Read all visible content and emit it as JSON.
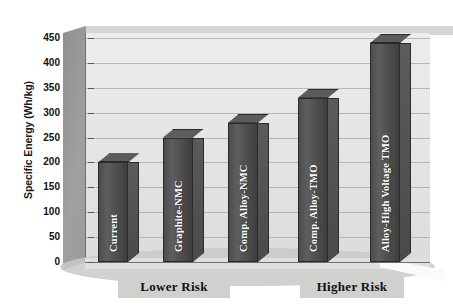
{
  "chart_data": {
    "type": "bar",
    "title": "",
    "subtitle": "",
    "xlabel": "",
    "ylabel": "Specific Energy (Wh/kg)",
    "ylim": [
      0,
      450
    ],
    "grid": true,
    "legend": "none",
    "style": "3d-bar",
    "categories": [
      "Current",
      "Graphite-NMC",
      "Comp. Alloy-NMC",
      "Comp. Alloy-TMO",
      "Alloy-High Voltage TMO"
    ],
    "values": [
      200,
      250,
      280,
      330,
      440
    ],
    "y_ticks": [
      0,
      50,
      100,
      150,
      200,
      250,
      300,
      350,
      400,
      450
    ],
    "groups": [
      {
        "label": "Lower Risk",
        "members": [
          "Current",
          "Graphite-NMC",
          "Comp. Alloy-NMC"
        ]
      },
      {
        "label": "Higher Risk",
        "members": [
          "Comp. Alloy-TMO",
          "Alloy-High Voltage TMO"
        ]
      }
    ],
    "colors": {
      "bar_face": "#4c4c4c",
      "bar_top": "#5c5c5c",
      "bar_side": "#4a4a4a",
      "bar_outline": "#2b2b2b",
      "plot_back_wall": "#e8e8e6",
      "plot_left_wall": "#989896",
      "gridline": "#b6b6b4",
      "floor": "#c9c9c7",
      "group_label_bg": "#d0d0ce",
      "text": "#111111",
      "bar_label_text": "#ffffff",
      "page_background": "#ffffff"
    }
  },
  "axis": {
    "y_title": "Specific Energy (Wh/kg)",
    "ticks": [
      {
        "value": "450"
      },
      {
        "value": "400"
      },
      {
        "value": "350"
      },
      {
        "value": "300"
      },
      {
        "value": "250"
      },
      {
        "value": "200"
      },
      {
        "value": "150"
      },
      {
        "value": "100"
      },
      {
        "value": "50"
      },
      {
        "value": "0"
      }
    ]
  },
  "bars": [
    {
      "label": "Current",
      "value": 200
    },
    {
      "label": "Graphite-NMC",
      "value": 250
    },
    {
      "label": "Comp. Alloy-NMC",
      "value": 280
    },
    {
      "label": "Comp. Alloy-TMO",
      "value": 330
    },
    {
      "label": "Alloy-High Voltage TMO",
      "value": 440
    }
  ],
  "groups": [
    {
      "label": "Lower Risk"
    },
    {
      "label": "Higher Risk"
    }
  ]
}
